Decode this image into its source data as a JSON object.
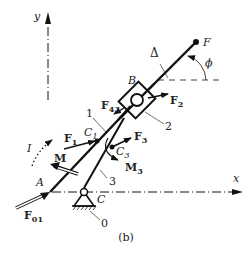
{
  "figure": {
    "caption": "(b)",
    "axes": {
      "x_label": "x",
      "y_label": "y"
    },
    "points": {
      "A": "A",
      "B": "B",
      "C": "C",
      "F": "F",
      "C1": "C",
      "C1_sub": "1",
      "C3": "C",
      "C3_sub": "3"
    },
    "links": {
      "link1": "1",
      "link2": "2",
      "link3": "3",
      "ground": "0",
      "rod": "Δ"
    },
    "angle": "ϕ",
    "forces": {
      "F01": "F",
      "F01_sub": "01",
      "F1": "F",
      "F1_sub": "1",
      "F2": "F",
      "F2_sub": "2",
      "F3": "F",
      "F3_sub": "3",
      "F43": "F",
      "F43_sub": "43"
    },
    "moments": {
      "M": "M",
      "M3": "M",
      "M3_sub": "3"
    },
    "rotation": "I"
  },
  "colors": {
    "ink": "#111111",
    "label": "#333333",
    "background": "#ffffff"
  }
}
